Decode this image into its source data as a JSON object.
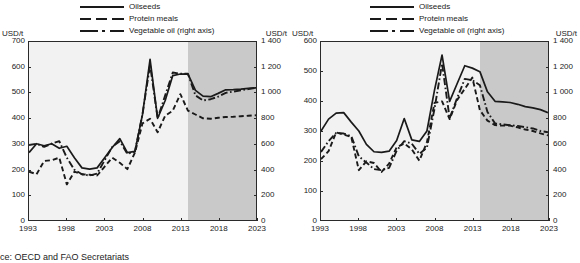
{
  "source_note": "ce: OECD and FAO Secretariats",
  "legend": {
    "items": [
      {
        "label": "Oilseeds",
        "style": "solid",
        "icon": "line-solid-icon"
      },
      {
        "label": "Protein meals",
        "style": "dashed",
        "icon": "line-dashed-icon"
      },
      {
        "label": "Vegetable oil (right axis)",
        "style": "dashdot",
        "icon": "line-dashdot-icon"
      }
    ]
  },
  "panels": [
    {
      "id": "nominal",
      "left_axis_unit": "USD/t",
      "right_axis_unit": "USD/t",
      "left_ticks": [
        "700",
        "600",
        "500",
        "400",
        "300",
        "200",
        "100",
        "0"
      ],
      "right_ticks": [
        "1 400",
        "1 200",
        "1 000",
        "800",
        "600",
        "400",
        "200",
        "0"
      ],
      "x_ticks": [
        "1993",
        "1998",
        "2003",
        "2008",
        "2013",
        "2018",
        "2023"
      ]
    },
    {
      "id": "real",
      "left_axis_unit": "USD/t",
      "right_axis_unit": "USD/t",
      "left_ticks": [
        "600",
        "500",
        "400",
        "300",
        "200",
        "100",
        "0"
      ],
      "right_ticks": [
        "1 400",
        "1 200",
        "1 000",
        "800",
        "600",
        "400",
        "200",
        "0"
      ],
      "x_ticks": [
        "1993",
        "1998",
        "2003",
        "2008",
        "2013",
        "2018",
        "2023"
      ]
    }
  ],
  "chart_data": [
    {
      "type": "line",
      "title": "",
      "xlabel": "",
      "ylabel": "USD/t",
      "y2label": "USD/t",
      "xlim": [
        1993,
        2023
      ],
      "ylim": [
        0,
        700
      ],
      "y2lim": [
        0,
        1400
      ],
      "grid": false,
      "legend_position": "top-center",
      "projection_start": 2014,
      "x": [
        1993,
        1994,
        1995,
        1996,
        1997,
        1998,
        1999,
        2000,
        2001,
        2002,
        2003,
        2004,
        2005,
        2006,
        2007,
        2008,
        2009,
        2010,
        2011,
        2012,
        2013,
        2014,
        2015,
        2016,
        2017,
        2018,
        2019,
        2020,
        2021,
        2022,
        2023
      ],
      "series": [
        {
          "name": "Oilseeds",
          "axis": "left",
          "style": "solid",
          "values": [
            265,
            300,
            292,
            300,
            282,
            290,
            245,
            205,
            200,
            205,
            245,
            285,
            320,
            265,
            270,
            415,
            632,
            400,
            470,
            568,
            574,
            575,
            510,
            487,
            485,
            498,
            512,
            513,
            515,
            518,
            520
          ]
        },
        {
          "name": "Protein meals",
          "axis": "left",
          "style": "dashed",
          "values": [
            190,
            180,
            232,
            235,
            245,
            140,
            190,
            180,
            178,
            175,
            210,
            245,
            225,
            200,
            265,
            380,
            398,
            345,
            410,
            430,
            495,
            430,
            415,
            400,
            398,
            402,
            405,
            406,
            408,
            410,
            412
          ]
        },
        {
          "name": "Vegetable oil (right axis)",
          "axis": "right",
          "style": "dashdot",
          "values": [
            590,
            600,
            575,
            600,
            620,
            490,
            395,
            360,
            350,
            365,
            470,
            575,
            620,
            520,
            538,
            832,
            1220,
            800,
            980,
            1160,
            1150,
            1150,
            980,
            940,
            950,
            970,
            1000,
            1010,
            1020,
            1030,
            1040
          ]
        }
      ]
    },
    {
      "type": "line",
      "title": "",
      "xlabel": "",
      "ylabel": "USD/t",
      "y2label": "USD/t",
      "xlim": [
        1993,
        2023
      ],
      "ylim": [
        0,
        600
      ],
      "y2lim": [
        0,
        1400
      ],
      "grid": false,
      "legend_position": "top-center",
      "projection_start": 2014,
      "x": [
        1993,
        1994,
        1995,
        1996,
        1997,
        1998,
        1999,
        2000,
        2001,
        2002,
        2003,
        2004,
        2005,
        2006,
        2007,
        2008,
        2009,
        2010,
        2011,
        2012,
        2013,
        2014,
        2015,
        2016,
        2017,
        2018,
        2019,
        2020,
        2021,
        2022,
        2023
      ],
      "series": [
        {
          "name": "Oilseeds",
          "axis": "left",
          "style": "solid",
          "values": [
            300,
            340,
            360,
            362,
            330,
            300,
            255,
            230,
            228,
            232,
            268,
            342,
            270,
            265,
            300,
            438,
            556,
            400,
            460,
            520,
            512,
            500,
            432,
            400,
            398,
            396,
            390,
            382,
            378,
            372,
            362
          ]
        },
        {
          "name": "Protein meals",
          "axis": "left",
          "style": "dashed",
          "values": [
            205,
            232,
            295,
            288,
            280,
            168,
            198,
            192,
            162,
            190,
            245,
            258,
            238,
            200,
            262,
            395,
            400,
            340,
            405,
            442,
            480,
            370,
            335,
            320,
            318,
            318,
            312,
            305,
            300,
            292,
            285
          ]
        },
        {
          "name": "Vegetable oil (right axis)",
          "axis": "right",
          "style": "dashdot",
          "values": [
            535,
            620,
            685,
            680,
            660,
            500,
            452,
            400,
            392,
            410,
            545,
            620,
            600,
            520,
            570,
            875,
            1230,
            800,
            960,
            1110,
            1100,
            1060,
            850,
            760,
            752,
            745,
            740,
            730,
            720,
            700,
            690
          ]
        }
      ]
    }
  ]
}
